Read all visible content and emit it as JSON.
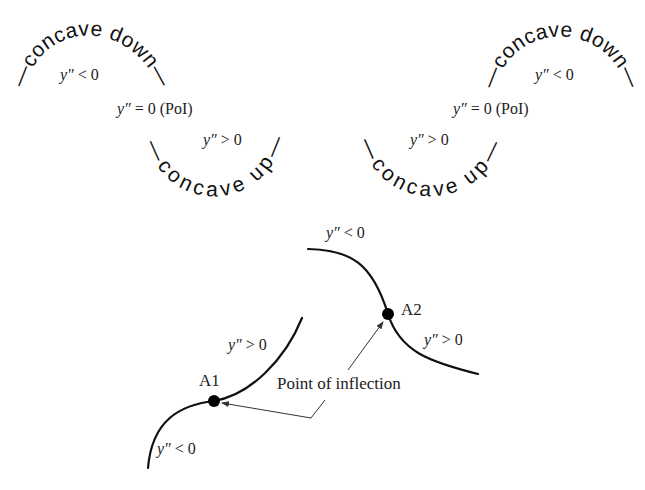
{
  "top_left": {
    "concave_down_text": "—concave down—",
    "concave_up_text": "—concave up—",
    "label_down": {
      "var": "y″",
      "rel": " < 0"
    },
    "label_poi": {
      "var": "y″",
      "rel": " = 0 (PoI)"
    },
    "label_up": {
      "var": "y″",
      "rel": " > 0"
    }
  },
  "top_right": {
    "concave_down_text": "—concave down—",
    "concave_up_text": "—concave up—",
    "label_down": {
      "var": "y″",
      "rel": " < 0"
    },
    "label_poi": {
      "var": "y″",
      "rel": " = 0 (PoI)"
    },
    "label_up": {
      "var": "y″",
      "rel": " > 0"
    }
  },
  "bottom": {
    "curve1": {
      "point_label": "A1",
      "upper_label": {
        "var": "y″",
        "rel": " > 0"
      },
      "lower_label": {
        "var": "y″",
        "rel": " < 0"
      }
    },
    "curve2": {
      "point_label": "A2",
      "upper_label": {
        "var": "y″",
        "rel": " < 0"
      },
      "lower_label": {
        "var": "y″",
        "rel": " > 0"
      }
    },
    "annotation": "Point of inflection"
  }
}
